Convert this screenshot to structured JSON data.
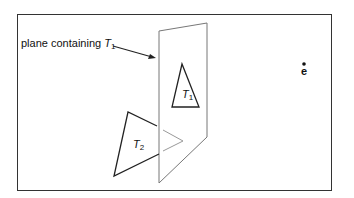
{
  "diagram": {
    "plane_label": {
      "text": "plane containing ",
      "var": "T",
      "sub": "1"
    },
    "triangle1_label": {
      "var": "T",
      "sub": "1"
    },
    "triangle2_label": {
      "var": "T",
      "sub": "2"
    },
    "eye_label": "e",
    "colors": {
      "frame": "#333333",
      "plane": "#777777",
      "triangle": "#222222",
      "projection": "#999999"
    }
  }
}
